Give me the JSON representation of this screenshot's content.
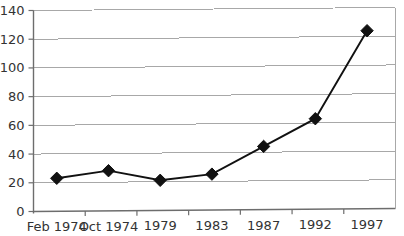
{
  "chart_data": {
    "type": "line",
    "title": "",
    "xlabel": "",
    "ylabel": "",
    "categories": [
      "Feb 1974",
      "Oct 1974",
      "1979",
      "1983",
      "1987",
      "1992",
      "1997"
    ],
    "values": [
      23,
      28,
      21,
      25,
      44,
      63,
      124
    ],
    "series": [
      {
        "name": "",
        "values": [
          23,
          28,
          21,
          25,
          44,
          63,
          124
        ]
      }
    ],
    "ylim": [
      0,
      140
    ],
    "ytick_labels": [
      "0",
      "20",
      "40",
      "60",
      "80",
      "100",
      "120",
      "140"
    ],
    "ytick_values": [
      0,
      20,
      40,
      60,
      80,
      100,
      120,
      140
    ],
    "ytick_step": 20,
    "grid": "horizontal",
    "legend": "none",
    "marker": "diamond",
    "colors": {
      "line": "#111111",
      "marker": "#111111",
      "gridline": "#a8a8a8",
      "axis": "#6d6d6d",
      "background": "#ffffff",
      "text": "#333333"
    }
  }
}
